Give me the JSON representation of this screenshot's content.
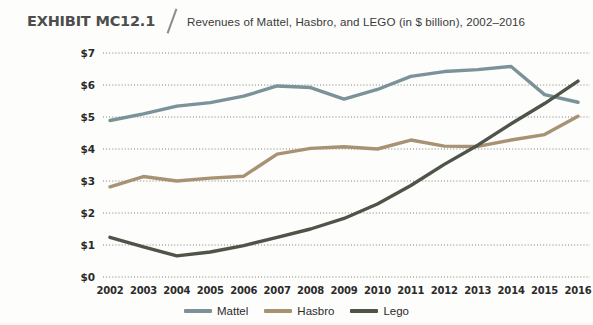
{
  "header": {
    "exhibit_label": "EXHIBIT MC12.1",
    "divider": "slash-divider",
    "subtitle": "Revenues of Mattel, Hasbro, and LEGO (in $ billion), 2002–2016"
  },
  "legend": {
    "position": "bottom-center",
    "items": [
      {
        "label": "Mattel",
        "color": "#7b9298"
      },
      {
        "label": "Hasbro",
        "color": "#a89274"
      },
      {
        "label": "Lego",
        "color": "#4e5448"
      }
    ]
  },
  "axes": {
    "y_ticks": [
      "$0",
      "$1",
      "$2",
      "$3",
      "$4",
      "$5",
      "$6",
      "$7"
    ],
    "x_ticks": [
      "2002",
      "2003",
      "2004",
      "2005",
      "2006",
      "2007",
      "2008",
      "2009",
      "2010",
      "2011",
      "2012",
      "2013",
      "2014",
      "2015",
      "2016"
    ],
    "grid": "horizontal-dotted"
  },
  "chart_data": {
    "type": "line",
    "title": "Revenues of Mattel, Hasbro, and LEGO (in $ billion), 2002–2016",
    "xlabel": "",
    "ylabel": "$ billion",
    "ylim": [
      0,
      7
    ],
    "xlim": [
      "2002",
      "2016"
    ],
    "ytick_values": [
      0,
      1,
      2,
      3,
      4,
      5,
      6,
      7
    ],
    "categories": [
      "2002",
      "2003",
      "2004",
      "2005",
      "2006",
      "2007",
      "2008",
      "2009",
      "2010",
      "2011",
      "2012",
      "2013",
      "2014",
      "2015",
      "2016"
    ],
    "grid": true,
    "legend_position": "bottom-center",
    "series": [
      {
        "name": "Mattel",
        "color": "#7b9298",
        "values": [
          4.89,
          5.1,
          5.34,
          5.45,
          5.65,
          5.97,
          5.92,
          5.56,
          5.86,
          6.27,
          6.42,
          6.48,
          6.58,
          5.7,
          5.46
        ]
      },
      {
        "name": "Hasbro",
        "color": "#a89274",
        "values": [
          2.82,
          3.14,
          3.0,
          3.09,
          3.15,
          3.84,
          4.02,
          4.07,
          4.0,
          4.28,
          4.09,
          4.08,
          4.28,
          4.45,
          5.02
        ]
      },
      {
        "name": "Lego",
        "color": "#4e5448",
        "values": [
          1.24,
          0.94,
          0.66,
          0.78,
          0.98,
          1.24,
          1.5,
          1.83,
          2.28,
          2.86,
          3.52,
          4.12,
          4.79,
          5.42,
          6.12
        ]
      }
    ]
  }
}
